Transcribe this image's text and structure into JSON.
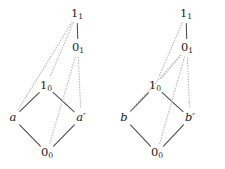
{
  "figure": {
    "background_color": "#ffffff",
    "solid_edge_color": "#4a4a4a",
    "dotted_edge_color": "#b9b9b9",
    "label_color": "#1a1a1a",
    "width": 225,
    "height": 169
  },
  "diagrams": [
    {
      "id": "left-diagram",
      "name": "left-lattice-diagram",
      "nodes": [
        {
          "id": "L-top",
          "name": "node-1-sub-1",
          "base": "1",
          "sub": "1",
          "italic": false,
          "x": 77,
          "y": 14
        },
        {
          "id": "L-zero1",
          "name": "node-0-sub-1",
          "base": "0",
          "sub": "1",
          "italic": false,
          "x": 78,
          "y": 48
        },
        {
          "id": "L-one0",
          "name": "node-1-sub-0",
          "base": "1",
          "sub": "0",
          "italic": false,
          "x": 46,
          "y": 86
        },
        {
          "id": "L-a",
          "name": "node-a",
          "base": "a",
          "sub": "",
          "italic": true,
          "x": 13,
          "y": 118
        },
        {
          "id": "L-aprime",
          "name": "node-a-prime",
          "base": "a′",
          "sub": "",
          "italic": true,
          "x": 81,
          "y": 118
        },
        {
          "id": "L-bottom",
          "name": "node-0-sub-0",
          "base": "0",
          "sub": "0",
          "italic": false,
          "x": 47,
          "y": 153
        }
      ],
      "edges": [
        {
          "name": "edge-1-1-to-0-1",
          "from": "L-top",
          "to": "L-zero1",
          "style": "solid"
        },
        {
          "name": "edge-1-0-to-a",
          "from": "L-one0",
          "to": "L-a",
          "style": "solid"
        },
        {
          "name": "edge-1-0-to-a-prime",
          "from": "L-one0",
          "to": "L-aprime",
          "style": "solid"
        },
        {
          "name": "edge-a-to-0-0",
          "from": "L-a",
          "to": "L-bottom",
          "style": "solid"
        },
        {
          "name": "edge-a-prime-to-0-0",
          "from": "L-aprime",
          "to": "L-bottom",
          "style": "solid"
        },
        {
          "name": "edge-1-1-to-1-0",
          "from": "L-top",
          "to": "L-one0",
          "style": "dotted"
        },
        {
          "name": "edge-1-1-to-a",
          "from": "L-top",
          "to": "L-a",
          "style": "dotted"
        },
        {
          "name": "edge-0-1-to-0-0",
          "from": "L-zero1",
          "to": "L-bottom",
          "style": "dotted"
        },
        {
          "name": "edge-0-1-to-a-prime",
          "from": "L-zero1",
          "to": "L-aprime",
          "style": "dotted"
        }
      ]
    },
    {
      "id": "right-diagram",
      "name": "right-lattice-diagram",
      "nodes": [
        {
          "id": "R-top",
          "name": "node-1-sub-1",
          "base": "1",
          "sub": "1",
          "italic": false,
          "x": 186,
          "y": 14
        },
        {
          "id": "R-zero1",
          "name": "node-0-sub-1",
          "base": "0",
          "sub": "1",
          "italic": false,
          "x": 187,
          "y": 48
        },
        {
          "id": "R-one0",
          "name": "node-1-sub-0",
          "base": "1",
          "sub": "0",
          "italic": false,
          "x": 155,
          "y": 86
        },
        {
          "id": "R-b",
          "name": "node-b",
          "base": "b",
          "sub": "",
          "italic": true,
          "x": 124,
          "y": 118
        },
        {
          "id": "R-bprime",
          "name": "node-b-prime",
          "base": "b′",
          "sub": "",
          "italic": true,
          "x": 190,
          "y": 118
        },
        {
          "id": "R-bottom",
          "name": "node-0-sub-0",
          "base": "0",
          "sub": "0",
          "italic": false,
          "x": 157,
          "y": 153
        }
      ],
      "edges": [
        {
          "name": "edge-1-1-to-0-1",
          "from": "R-top",
          "to": "R-zero1",
          "style": "solid"
        },
        {
          "name": "edge-1-0-to-b",
          "from": "R-one0",
          "to": "R-b",
          "style": "solid"
        },
        {
          "name": "edge-1-0-to-b-prime",
          "from": "R-one0",
          "to": "R-bprime",
          "style": "solid"
        },
        {
          "name": "edge-b-to-0-0",
          "from": "R-b",
          "to": "R-bottom",
          "style": "solid"
        },
        {
          "name": "edge-b-prime-to-0-0",
          "from": "R-bprime",
          "to": "R-bottom",
          "style": "solid"
        },
        {
          "name": "edge-1-1-to-1-0",
          "from": "R-top",
          "to": "R-one0",
          "style": "dotted"
        },
        {
          "name": "edge-0-1-to-1-0",
          "from": "R-zero1",
          "to": "R-one0",
          "style": "dotted"
        },
        {
          "name": "edge-0-1-to-b",
          "from": "R-zero1",
          "to": "R-b",
          "style": "dotted"
        },
        {
          "name": "edge-0-1-to-0-0",
          "from": "R-zero1",
          "to": "R-bottom",
          "style": "dotted"
        },
        {
          "name": "edge-0-1-to-b-prime",
          "from": "R-zero1",
          "to": "R-bprime",
          "style": "dotted"
        }
      ]
    }
  ]
}
